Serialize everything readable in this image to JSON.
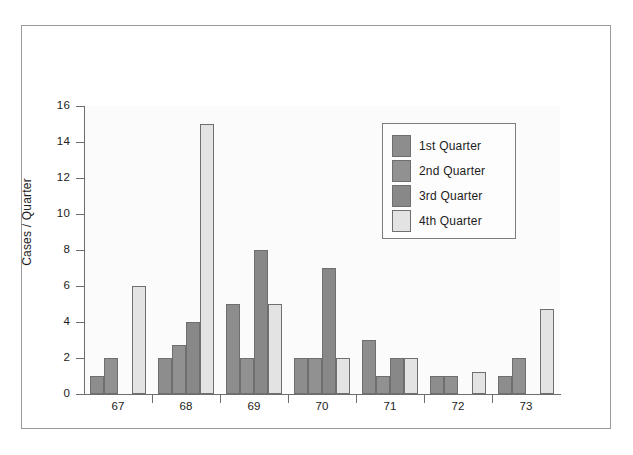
{
  "chart_data": {
    "type": "bar",
    "title": "",
    "xlabel": "",
    "ylabel": "Cases / Quarter",
    "categories": [
      "67",
      "68",
      "69",
      "70",
      "71",
      "72",
      "73"
    ],
    "ylim": [
      0,
      16
    ],
    "ytick_step": 2,
    "ytick_labels": [
      "0",
      "2",
      "4",
      "6",
      "8",
      "10",
      "12",
      "14",
      "16"
    ],
    "grid": false,
    "legend_position": "upper-right",
    "series": [
      {
        "name": "1st Quarter",
        "color": "#8d8d8d",
        "values": [
          1,
          2,
          5,
          2,
          3,
          1,
          1
        ]
      },
      {
        "name": "2nd Quarter",
        "color": "#919191",
        "values": [
          2,
          2.7,
          2,
          2,
          1,
          1,
          2
        ]
      },
      {
        "name": "3rd Quarter",
        "color": "#888888",
        "values": [
          0,
          4,
          8,
          7,
          2,
          0,
          0
        ]
      },
      {
        "name": "4th Quarter",
        "color": "#e3e3e3",
        "values": [
          6,
          15,
          5,
          2,
          2,
          1.2,
          4.7
        ]
      }
    ]
  },
  "colors": {
    "bar_border": "#6f6f6f",
    "axis": "#6e6e6e",
    "frame": "#9a9a9a",
    "plot_background": "#fbfbfb",
    "text": "#1c1c1c"
  }
}
